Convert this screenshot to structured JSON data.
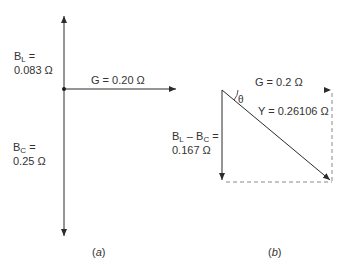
{
  "figure": {
    "panel_a": {
      "caption": "a",
      "labels": {
        "bl_symbol": "B",
        "bl_sub": "L",
        "bl_eq": " =",
        "bl_value": "0.083 Ω",
        "g_label": "G = 0.20 Ω",
        "bc_symbol": "B",
        "bc_sub": "C",
        "bc_eq": " =",
        "bc_value": "0.25 Ω"
      }
    },
    "panel_b": {
      "caption": "b",
      "labels": {
        "g_label": "G = 0.2 Ω",
        "theta": "θ",
        "y_label": "Y = 0.26106 Ω",
        "b_sym1": "B",
        "b_sub1": "L",
        "b_minus": " – ",
        "b_sym2": "B",
        "b_sub2": "C",
        "b_eq": " =",
        "b_value": "0.167 Ω"
      }
    },
    "colors": {
      "line": "#2b2b2b",
      "dashed": "#8a8a8a",
      "text": "#333333"
    }
  }
}
